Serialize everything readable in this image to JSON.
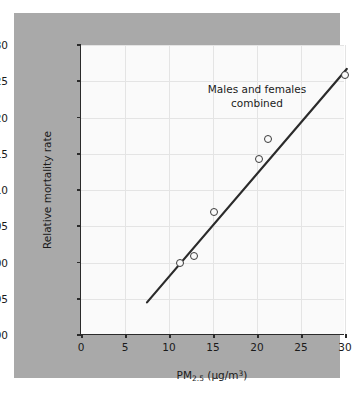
{
  "figure": {
    "background_color": "#ffffff",
    "panel_color": "#a9a9a9",
    "plot_background_color": "#fafafa",
    "axis_color": "#2b2b2b",
    "grid_color": "#e4e4e4",
    "marker_edge_color": "#3a3a3a",
    "line_color": "#2b2b2b"
  },
  "chart_data": {
    "type": "scatter",
    "title": "",
    "annotation": [
      "Males and females",
      "combined"
    ],
    "xlabel_text": "PM",
    "xlabel_sub": "2.5",
    "xlabel_unit": " (μg/m",
    "xlabel_sup": "3",
    "xlabel_close": ")",
    "xlabel_full": "PM2.5 (μg/m3)",
    "ylabel": "Relative mortality rate",
    "xlim": [
      0,
      30
    ],
    "ylim": [
      0.9,
      1.3
    ],
    "xticks": [
      0,
      5,
      10,
      15,
      20,
      25,
      30
    ],
    "xticklabels": [
      "0",
      "5",
      "10",
      "15",
      "20",
      "25",
      "30"
    ],
    "yticks": [
      0.9,
      0.95,
      1.0,
      1.05,
      1.1,
      1.15,
      1.2,
      1.25,
      1.3
    ],
    "yticklabels": [
      "0.90",
      "0.95",
      "1.00",
      "1.05",
      "1.10",
      "1.15",
      "1.20",
      "1.25",
      "1.30"
    ],
    "grid": true,
    "legend": null,
    "points": [
      {
        "x": 11.3,
        "y": 1.0
      },
      {
        "x": 12.8,
        "y": 1.009
      },
      {
        "x": 15.1,
        "y": 1.07
      },
      {
        "x": 20.2,
        "y": 1.143
      },
      {
        "x": 21.2,
        "y": 1.17
      },
      {
        "x": 30.0,
        "y": 1.258
      }
    ],
    "fit_line": {
      "x_start": 7.5,
      "y_start": 0.945,
      "x_end": 30.2,
      "y_end": 1.267
    }
  }
}
